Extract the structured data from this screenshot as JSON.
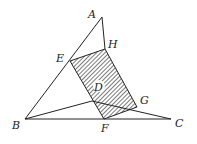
{
  "diagram": {
    "type": "geometry",
    "points": {
      "A": {
        "label": "A",
        "x": 102,
        "y": 17
      },
      "B": {
        "label": "B",
        "x": 25,
        "y": 119
      },
      "C": {
        "label": "C",
        "x": 171,
        "y": 119
      },
      "E": {
        "label": "E",
        "x": 70,
        "y": 61
      },
      "H": {
        "label": "H",
        "x": 105,
        "y": 49
      },
      "G": {
        "label": "G",
        "x": 137,
        "y": 107
      },
      "F": {
        "label": "F",
        "x": 104,
        "y": 119
      },
      "D": {
        "label": "D",
        "x": 97,
        "y": 88
      }
    },
    "shaded_region": "EHGF",
    "segments": [
      "AB",
      "AH",
      "BC",
      "BD",
      "DC",
      "EH",
      "HG",
      "GF",
      "FE"
    ],
    "colors": {
      "line": "#222222",
      "hatch": "#333333",
      "background": "#ffffff"
    }
  }
}
